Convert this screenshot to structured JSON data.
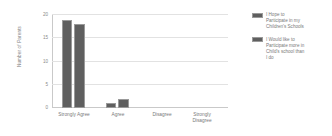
{
  "chart_data": {
    "type": "bar",
    "title": "",
    "subtitle": "",
    "xlabel": "",
    "ylabel": "Number of Parents",
    "ylim": [
      0,
      20
    ],
    "yticks": [
      0,
      5,
      10,
      15,
      20
    ],
    "ytick_labels": [
      "0",
      "5",
      "10",
      "15",
      "20"
    ],
    "grid": true,
    "legend_position": "right",
    "categories": [
      "Strongly Agree",
      "Agree",
      "Disagree",
      "Strongly Disagree"
    ],
    "series": [
      {
        "name": "I Hope to Participate in my Children's Schools",
        "values": [
          19,
          1,
          0,
          0
        ],
        "color": "#5f5f5f"
      },
      {
        "name": "I Would like to Participate more in Child's school than I do",
        "values": [
          18,
          2,
          0,
          0
        ],
        "color": "#5f5f5f"
      }
    ]
  },
  "axis": {
    "y_title": "Number of Parents",
    "y_tick_0": "0",
    "y_tick_1": "5",
    "y_tick_2": "10",
    "y_tick_3": "15",
    "y_tick_4": "20"
  },
  "categories": {
    "c0": "Strongly Agree",
    "c1": "Agree",
    "c2": "Disagree",
    "c3": "Strongly Disagree"
  },
  "legend": {
    "entry_0": "I Hope to Participate in my Children's Schools",
    "entry_1": "I Would like to Participate more in Child's school than I do"
  },
  "colors": {
    "bar_fill": "#5f5f5f",
    "bar_border": "#9a9a9a",
    "gridline": "#e2e2e2",
    "axis": "#c9c9c9",
    "text": "#7a7a7a",
    "background": "#ffffff"
  }
}
